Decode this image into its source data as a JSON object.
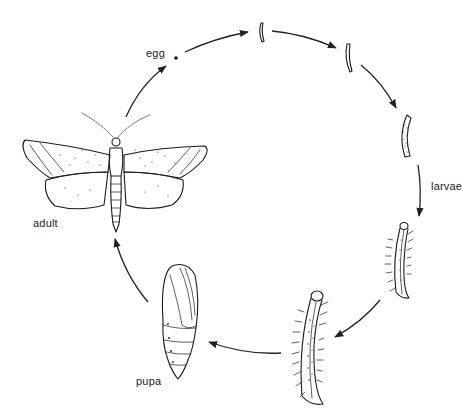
{
  "diagram": {
    "type": "life-cycle",
    "stages": [
      {
        "id": "egg",
        "label": "egg"
      },
      {
        "id": "larvae",
        "label": "larvae",
        "count": 5
      },
      {
        "id": "pupa",
        "label": "pupa"
      },
      {
        "id": "adult",
        "label": "adult"
      }
    ],
    "flow": [
      "adult",
      "egg",
      "larva-1",
      "larva-2",
      "larva-3",
      "larva-4",
      "larva-5",
      "pupa",
      "adult"
    ],
    "colors": {
      "ink": "#1a1a1a",
      "background": "#ffffff"
    }
  },
  "labels": {
    "egg": "egg",
    "larvae": "larvae",
    "pupa": "pupa",
    "adult": "adult"
  }
}
